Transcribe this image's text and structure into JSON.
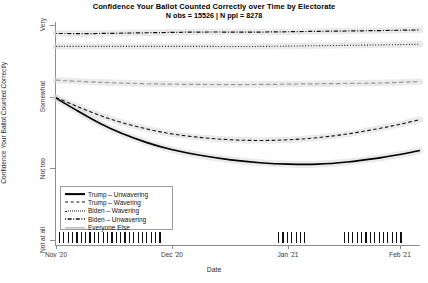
{
  "chart": {
    "title": "Confidence Your Ballot Counted Correctly over Time by Electorate",
    "subtitle": "N obs = 15526 | N ppl = 8278",
    "xlabel": "Date",
    "ylabel": "Confidence Your Ballot Counted Correctly"
  },
  "chart_data": {
    "type": "line",
    "title": "Confidence Your Ballot Counted Correctly over Time by Electorate",
    "subtitle": "N obs = 15526 | N ppl = 8278",
    "xlabel": "Date",
    "ylabel": "Confidence Your Ballot Counted Correctly",
    "grid": false,
    "legend_position": "bottom-left",
    "x_ticklabels": [
      "Nov '20",
      "Dec '20",
      "Jan '21",
      "Feb '21"
    ],
    "x_tick_positions": [
      0.0,
      0.3186,
      0.6374,
      0.9451
    ],
    "y_ticklabels": [
      "Not at all",
      "Not too",
      "Somewhat",
      "Very"
    ],
    "y_values": [
      1,
      2,
      3,
      4
    ],
    "ylim": [
      0.92,
      4.04
    ],
    "xlim_note": "Nov 3 2020 through early Feb 2021",
    "series": [
      {
        "name": "Trump - Unwavering",
        "style": "solid",
        "color": "#000000",
        "width": 1.6,
        "x": [
          0.0,
          0.06,
          0.12,
          0.18,
          0.25,
          0.32,
          0.4,
          0.48,
          0.56,
          0.64,
          0.72,
          0.8,
          0.88,
          0.94,
          1.0
        ],
        "y": [
          2.98,
          2.8,
          2.63,
          2.49,
          2.36,
          2.26,
          2.18,
          2.12,
          2.08,
          2.06,
          2.06,
          2.09,
          2.14,
          2.19,
          2.25
        ]
      },
      {
        "name": "Trump - Wavering",
        "style": "dashed",
        "color": "#111111",
        "width": 1.1,
        "x": [
          0.0,
          0.06,
          0.12,
          0.18,
          0.25,
          0.32,
          0.4,
          0.48,
          0.56,
          0.64,
          0.72,
          0.8,
          0.88,
          0.94,
          1.0
        ],
        "y": [
          2.99,
          2.86,
          2.74,
          2.64,
          2.55,
          2.48,
          2.43,
          2.4,
          2.39,
          2.4,
          2.43,
          2.48,
          2.55,
          2.61,
          2.68
        ]
      },
      {
        "name": "Biden - Wavering",
        "style": "dotted",
        "color": "#111111",
        "width": 1.1,
        "x": [
          0.0,
          0.12,
          0.25,
          0.4,
          0.56,
          0.72,
          0.88,
          1.0
        ],
        "y": [
          3.7,
          3.7,
          3.7,
          3.7,
          3.7,
          3.71,
          3.72,
          3.73
        ]
      },
      {
        "name": "Biden - Unwavering",
        "style": "dashdot",
        "color": "#111111",
        "width": 1.2,
        "x": [
          0.0,
          0.12,
          0.25,
          0.4,
          0.56,
          0.72,
          0.88,
          1.0
        ],
        "y": [
          3.88,
          3.88,
          3.89,
          3.9,
          3.9,
          3.91,
          3.92,
          3.93
        ]
      },
      {
        "name": "Everyone Else",
        "style": "dashed-gray",
        "color": "#9a9a9a",
        "width": 1.2,
        "x": [
          0.0,
          0.12,
          0.25,
          0.4,
          0.56,
          0.72,
          0.88,
          1.0
        ],
        "y": [
          3.23,
          3.2,
          3.18,
          3.17,
          3.17,
          3.18,
          3.19,
          3.21
        ]
      }
    ],
    "rug": {
      "description": "tick marks at bottom showing survey wave dates",
      "positions": [
        0.008,
        0.02,
        0.032,
        0.044,
        0.056,
        0.068,
        0.08,
        0.092,
        0.104,
        0.116,
        0.128,
        0.14,
        0.152,
        0.164,
        0.176,
        0.188,
        0.2,
        0.212,
        0.224,
        0.236,
        0.248,
        0.26,
        0.272,
        0.284,
        0.61,
        0.622,
        0.634,
        0.646,
        0.658,
        0.67,
        0.682,
        0.79,
        0.802,
        0.814,
        0.826,
        0.838,
        0.85,
        0.862,
        0.874,
        0.886,
        0.898,
        0.91,
        0.922,
        0.934,
        0.946
      ]
    }
  },
  "legend": {
    "items": [
      {
        "label": "Trump – Unwavering"
      },
      {
        "label": "Trump – Wavering"
      },
      {
        "label": "Biden – Wavering"
      },
      {
        "label": "Biden – Unwavering"
      },
      {
        "label": "Everyone Else"
      }
    ]
  }
}
